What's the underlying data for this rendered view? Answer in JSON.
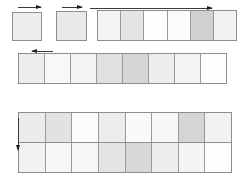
{
  "figure": {
    "type": "diagram",
    "canvas": {
      "width": 244,
      "height": 180,
      "background": "#ffffff"
    },
    "palette": {
      "outline": "#8e8e8e",
      "grid": "#9a9a9a",
      "arrow": "#1f1f1f",
      "white": "#ffffff",
      "shade_lightest": "#fafafa",
      "shade_light": "#f1f1f1",
      "shade_mid_light": "#e9e9e9",
      "shade_mid": "#e0e0e0",
      "shade_dark": "#d2d2d2",
      "shade_darkest": "#c6c6c6"
    }
  },
  "shapes": [
    {
      "id": "square-1",
      "name": "standalone-square-left",
      "kind": "square",
      "x": 12,
      "y": 12,
      "width": 30,
      "height": 29,
      "fill": "#eeeeee"
    },
    {
      "id": "square-2",
      "name": "standalone-square-second",
      "kind": "square",
      "x": 56,
      "y": 11,
      "width": 31,
      "height": 30,
      "fill": "#e9e9e9"
    },
    {
      "id": "block-top",
      "name": "top-strip-block",
      "kind": "block",
      "x": 97,
      "y": 10,
      "width": 140,
      "height": 31,
      "rows": [
        {
          "cells": [
            "#f4f4f4",
            "#e4e4e4",
            "#fdfdfd",
            "#fbfbfb",
            "#d0d0d0",
            "#f2f2f2"
          ]
        }
      ]
    },
    {
      "id": "block-middle",
      "name": "middle-strip-block",
      "kind": "block",
      "x": 18,
      "y": 53,
      "width": 209,
      "height": 31,
      "rows": [
        {
          "cells": [
            "#ededed",
            "#f8f8f8",
            "#f4f4f4",
            "#e0e0e0",
            "#d6d6d6",
            "#eeeeee",
            "#f3f3f3",
            "#fdfdfd"
          ]
        }
      ]
    },
    {
      "id": "block-bottom",
      "name": "bottom-double-row-block",
      "kind": "block",
      "x": 18,
      "y": 112,
      "width": 214,
      "height": 61,
      "rows": [
        {
          "cells": [
            "#ebebeb",
            "#e2e2e2",
            "#fbfbfb",
            "#ececec",
            "#fafafa",
            "#f7f7f7",
            "#d5d5d5",
            "#f2f2f2"
          ]
        },
        {
          "cells": [
            "#f2f2f2",
            "#f7f7f7",
            "#f6f6f6",
            "#e4e4e4",
            "#d8d8d8",
            "#eeeeee",
            "#f4f4f4",
            "#fdfdfd"
          ]
        }
      ]
    }
  ],
  "arrows": [
    {
      "id": "arrow-1",
      "name": "dimension-arrow-square-1",
      "orientation": "horizontal",
      "direction": "right",
      "x": 18,
      "y": 3,
      "length": 23
    },
    {
      "id": "arrow-2",
      "name": "dimension-arrow-square-2",
      "orientation": "horizontal",
      "direction": "right",
      "x": 62,
      "y": 3,
      "length": 20
    },
    {
      "id": "arrow-3",
      "name": "dimension-arrow-top-block",
      "orientation": "horizontal",
      "direction": "right",
      "x": 90,
      "y": 4,
      "length": 122
    },
    {
      "id": "arrow-4",
      "name": "dimension-arrow-middle-block",
      "orientation": "horizontal",
      "direction": "left",
      "x": 32,
      "y": 47,
      "length": 21
    },
    {
      "id": "arrow-5",
      "name": "dimension-arrow-bottom-block-vertical",
      "orientation": "vertical",
      "direction": "down",
      "x": 14,
      "y": 118,
      "length": 32
    }
  ]
}
